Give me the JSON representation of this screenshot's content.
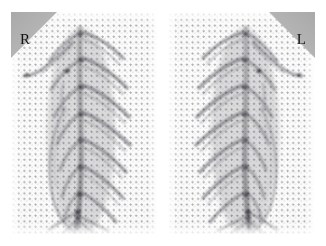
{
  "viewer": {
    "background_color": "#ffffff",
    "width": 326,
    "height": 246,
    "modality_note": "dual-panel radiographic image with dotted mesh overlay"
  },
  "panels": [
    {
      "id": "right-view",
      "side_marker": "R",
      "marker_position": "top-left",
      "marker_color": "#b4b4b4",
      "marker_text_color": "#111111"
    },
    {
      "id": "left-view",
      "side_marker": "L",
      "marker_position": "top-right",
      "marker_color": "#b4b4b4",
      "marker_text_color": "#111111"
    }
  ],
  "markers": {
    "right_label": "R",
    "left_label": "L"
  },
  "overlay": {
    "grid_type": "dotted-mesh",
    "dot_spacing_px": 5.6,
    "dot_color": "#3c3c40"
  }
}
